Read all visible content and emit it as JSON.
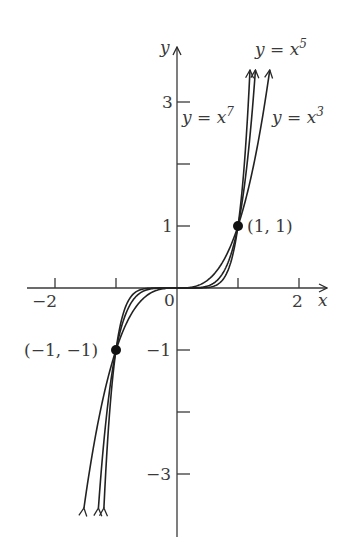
{
  "chart_data": {
    "type": "line",
    "title": "",
    "xlabel": "x",
    "ylabel": "y",
    "xlim": [
      -2.5,
      2.5
    ],
    "ylim": [
      -4,
      4
    ],
    "grid": false,
    "x_ticks": [
      -2,
      -1,
      1,
      2
    ],
    "x_tick_labels": [
      "−2",
      "2"
    ],
    "y_ticks": [
      -3,
      -2,
      -1,
      1,
      2,
      3
    ],
    "y_tick_labels": [
      "3",
      "1",
      "−1",
      "−3"
    ],
    "origin_label": "0",
    "series": [
      {
        "name": "y = x^3",
        "label_text": "y = x",
        "exponent": 3
      },
      {
        "name": "y = x^5",
        "label_text": "y = x",
        "exponent": 5
      },
      {
        "name": "y = x^7",
        "label_text": "y = x",
        "exponent": 7
      }
    ],
    "points": [
      {
        "x": 1,
        "y": 1,
        "label": "(1, 1)"
      },
      {
        "x": -1,
        "y": -1,
        "label": "(−1, −1)"
      }
    ]
  },
  "labels": {
    "x_axis": "x",
    "y_axis": "y",
    "origin": "0",
    "x_minus2": "−2",
    "x_2": "2",
    "y_3": "3",
    "y_1": "1",
    "y_minus1": "−1",
    "y_minus3": "−3",
    "curve_x3": "y = x",
    "curve_x3_exp": "3",
    "curve_x5": "y = x",
    "curve_x5_exp": "5",
    "curve_x7": "y = x",
    "curve_x7_exp": "7",
    "point_pos": "(1, 1)",
    "point_neg": "(−1, −1)"
  },
  "colors": {
    "axis": "#3a3a3a",
    "curve": "#222222",
    "point": "#111111",
    "text": "#3a3a3a"
  }
}
